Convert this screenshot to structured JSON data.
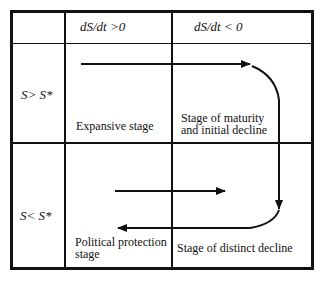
{
  "header": {
    "col1": "dS/dt >0",
    "col2": "dS/dt < 0"
  },
  "rows": [
    {
      "label": "S> S*",
      "cells": [
        {
          "text": "Expansive stage"
        },
        {
          "text_line1": "Stage of maturity",
          "text_line2": "and initial decline"
        }
      ]
    },
    {
      "label": "S< S*",
      "cells": [
        {
          "text_line1": "Political protection",
          "text_line2": "stage"
        },
        {
          "text": "Stage of distinct decline"
        }
      ]
    }
  ],
  "colors": {
    "line": "#111111",
    "background": "#ffffff"
  }
}
